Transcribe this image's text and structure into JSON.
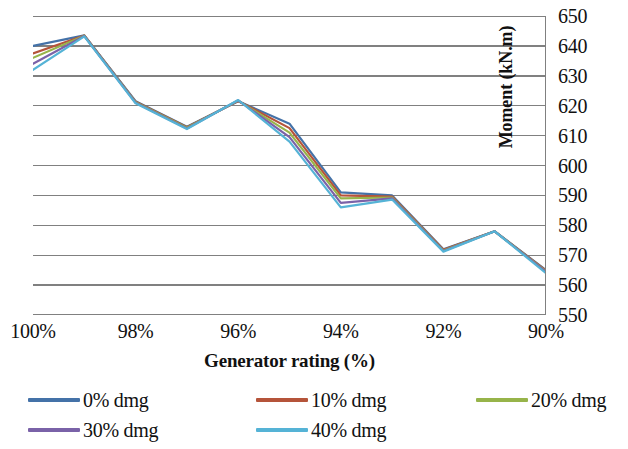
{
  "chart_data": {
    "type": "line",
    "title": "",
    "xlabel": "Generator rating (%)",
    "ylabel": "Moment (kN.m)",
    "x": [
      100,
      99,
      98,
      97,
      96,
      95,
      94,
      93,
      92,
      91,
      90
    ],
    "categories": [
      "100%",
      "99%",
      "98%",
      "97%",
      "96%",
      "95%",
      "94%",
      "93%",
      "92%",
      "91%",
      "90%"
    ],
    "xtick_labels": [
      "100%",
      "98%",
      "96%",
      "94%",
      "92%",
      "90%"
    ],
    "xtick_values": [
      100,
      98,
      96,
      94,
      92,
      90
    ],
    "xlim": [
      100,
      90
    ],
    "ylim": [
      550,
      650
    ],
    "ytick_labels": [
      "650",
      "640",
      "630",
      "620",
      "610",
      "600",
      "590",
      "580",
      "570",
      "560",
      "550"
    ],
    "ytick_values": [
      650,
      640,
      630,
      620,
      610,
      600,
      590,
      580,
      570,
      560,
      550
    ],
    "ystep": 10,
    "grid": "horizontal",
    "legend_position": "bottom",
    "series": [
      {
        "name": "0% dmg",
        "color": "#4472a8",
        "values": [
          640.0,
          643.5,
          621.5,
          613.0,
          621.5,
          614.0,
          591.0,
          590.0,
          572.0,
          578.0,
          565.0
        ]
      },
      {
        "name": "10% dmg",
        "color": "#b5543a",
        "values": [
          637.5,
          643.5,
          621.3,
          612.8,
          621.6,
          612.5,
          590.0,
          589.6,
          571.8,
          578.0,
          564.8
        ]
      },
      {
        "name": "20% dmg",
        "color": "#97b44a",
        "values": [
          636.0,
          643.4,
          621.2,
          612.6,
          621.7,
          611.0,
          589.0,
          589.3,
          571.6,
          578.0,
          564.6
        ]
      },
      {
        "name": "30% dmg",
        "color": "#7a62a8",
        "values": [
          634.0,
          643.3,
          621.0,
          612.4,
          621.8,
          609.5,
          587.5,
          589.0,
          571.4,
          578.0,
          564.4
        ]
      },
      {
        "name": "40% dmg",
        "color": "#55b3d6",
        "values": [
          632.0,
          643.2,
          620.8,
          612.2,
          621.9,
          608.0,
          586.0,
          588.6,
          571.2,
          578.0,
          564.0
        ]
      }
    ],
    "legend_entries": [
      {
        "label": "0% dmg",
        "color": "#4472a8"
      },
      {
        "label": "10% dmg",
        "color": "#b5543a"
      },
      {
        "label": "20% dmg",
        "color": "#97b44a"
      },
      {
        "label": "30% dmg",
        "color": "#7a62a8"
      },
      {
        "label": "40% dmg",
        "color": "#55b3d6"
      }
    ],
    "axis_color": "#808080",
    "grid_color": "#808080"
  }
}
